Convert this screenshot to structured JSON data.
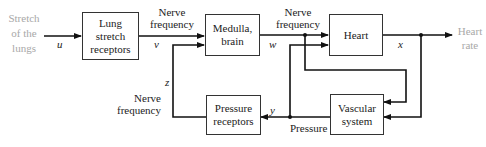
{
  "diagram": {
    "type": "block-diagram",
    "input": {
      "text_lines": [
        "Stretch",
        "of the",
        "lungs"
      ],
      "variable": "u"
    },
    "output": {
      "text_lines": [
        "Heart",
        "rate"
      ],
      "variable": "x"
    },
    "blocks": [
      {
        "id": "lung",
        "lines": [
          "Lung",
          "stretch",
          "receptors"
        ]
      },
      {
        "id": "medulla",
        "lines": [
          "Medulla,",
          "brain"
        ]
      },
      {
        "id": "heart",
        "lines": [
          "Heart"
        ]
      },
      {
        "id": "pressure",
        "lines": [
          "Pressure",
          "receptors"
        ]
      },
      {
        "id": "vascular",
        "lines": [
          "Vascular",
          "system"
        ]
      }
    ],
    "signals": {
      "v": {
        "variable": "v",
        "label_lines": [
          "Nerve",
          "frequency"
        ]
      },
      "w": {
        "variable": "w",
        "label_lines": [
          "Nerve",
          "frequency"
        ]
      },
      "y": {
        "variable": "y",
        "label": "Pressure"
      },
      "z": {
        "variable": "z",
        "label_lines": [
          "Nerve",
          "frequency"
        ]
      }
    },
    "colors": {
      "line": "#111111",
      "muted_text": "#a8a8a8",
      "text": "#222222"
    }
  }
}
